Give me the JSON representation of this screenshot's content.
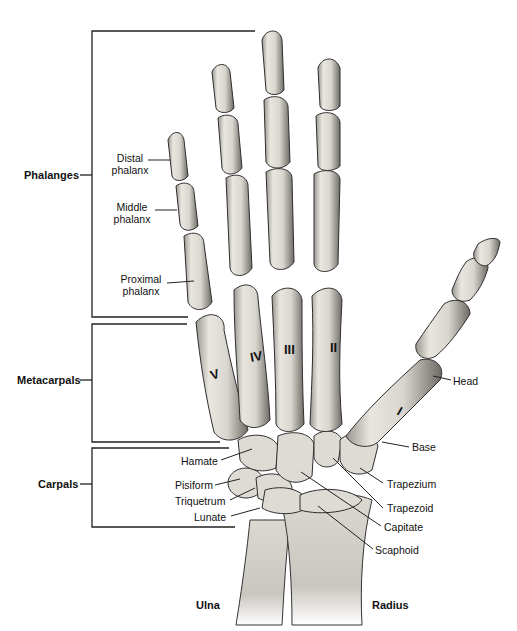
{
  "groups": {
    "phalanges": "Phalanges",
    "metacarpals": "Metacarpals",
    "carpals": "Carpals"
  },
  "phalanx_labels": {
    "distal": [
      "Distal",
      "phalanx"
    ],
    "middle": [
      "Middle",
      "phalanx"
    ],
    "proximal": [
      "Proximal",
      "phalanx"
    ]
  },
  "metacarpal_numerals": [
    "I",
    "II",
    "III",
    "IV",
    "V"
  ],
  "metacarpal_parts": {
    "head": "Head",
    "base": "Base"
  },
  "carpals_left": [
    "Hamate",
    "Pisiform",
    "Triquetrum",
    "Lunate"
  ],
  "carpals_right": [
    "Trapezium",
    "Trapezoid",
    "Capitate",
    "Scaphoid"
  ],
  "forearm": {
    "ulna": "Ulna",
    "radius": "Radius"
  },
  "colors": {
    "bone_fill": "#e4e1da",
    "bone_shadow": "#8f8c86",
    "outline": "#2a2a2a",
    "text": "#111111"
  }
}
